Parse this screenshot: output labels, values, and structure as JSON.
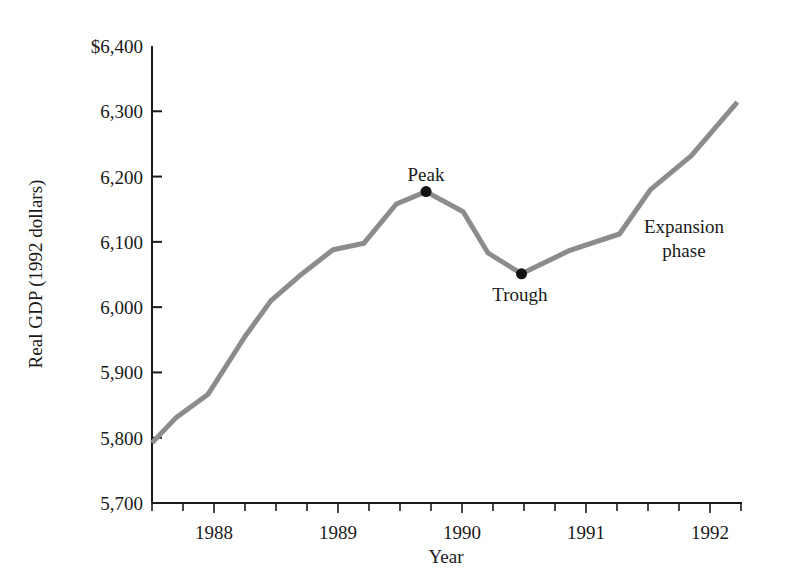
{
  "chart_data": {
    "type": "line",
    "title": "",
    "xlabel": "Year",
    "ylabel": "Real GDP (1992 dollars)",
    "ylim": [
      5700,
      6400
    ],
    "xlim": [
      1987.5,
      1992.25
    ],
    "grid": false,
    "legend": null,
    "y_ticks": [
      {
        "value": 5700,
        "label": "5,700"
      },
      {
        "value": 5800,
        "label": "5,800"
      },
      {
        "value": 5900,
        "label": "5,900"
      },
      {
        "value": 6000,
        "label": "6,000"
      },
      {
        "value": 6100,
        "label": "6,100"
      },
      {
        "value": 6200,
        "label": "6,200"
      },
      {
        "value": 6300,
        "label": "6,300"
      },
      {
        "value": 6400,
        "label": "$6,400"
      }
    ],
    "x_ticks": [
      {
        "value": 1988,
        "label": "1988"
      },
      {
        "value": 1989,
        "label": "1989"
      },
      {
        "value": 1990,
        "label": "1990"
      },
      {
        "value": 1991,
        "label": "1991"
      },
      {
        "value": 1992,
        "label": "1992"
      }
    ],
    "x_minor_tick_step": 0.25,
    "series": [
      {
        "name": "Real GDP",
        "color": "#8c8c8c",
        "x": [
          1987.5,
          1987.69,
          1987.95,
          1988.25,
          1988.46,
          1988.69,
          1988.96,
          1989.21,
          1989.47,
          1989.71,
          1990.01,
          1990.21,
          1990.48,
          1990.87,
          1991.27,
          1991.52,
          1991.85,
          1992.22
        ],
        "values": [
          5792,
          5830,
          5866,
          5955,
          6010,
          6048,
          6088,
          6098,
          6158,
          6177,
          6146,
          6083,
          6051,
          6087,
          6112,
          6180,
          6232,
          6314
        ]
      }
    ],
    "annotations": [
      {
        "text": "Peak",
        "x": 1989.71,
        "y": 6177,
        "marker": true
      },
      {
        "text": "Trough",
        "x": 1990.48,
        "y": 6051,
        "marker": true
      },
      {
        "text": "Expansion",
        "x": 1991.75,
        "y": 6120,
        "marker": false
      },
      {
        "text": "phase",
        "x": 1991.75,
        "y": 6085,
        "marker": false
      }
    ]
  },
  "labels": {
    "ylabel": "Real GDP (1992 dollars)",
    "xlabel": "Year",
    "peak": "Peak",
    "trough": "Trough",
    "expansion_line1": "Expansion",
    "expansion_line2": "phase"
  }
}
